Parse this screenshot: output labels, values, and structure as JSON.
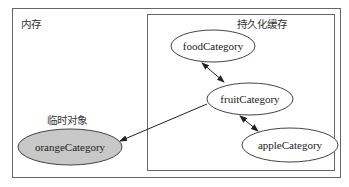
{
  "diagram": {
    "regions": {
      "memory": {
        "label": "内存"
      },
      "persistent_cache": {
        "label": "持久化缓存"
      }
    },
    "nodes": [
      {
        "id": "food",
        "label": "foodCategory",
        "fill": "#ffffff"
      },
      {
        "id": "fruit",
        "label": "fruitCategory",
        "fill": "#ffffff"
      },
      {
        "id": "apple",
        "label": "appleCategory",
        "fill": "#ffffff"
      },
      {
        "id": "orange",
        "label": "orangeCategory",
        "fill": "#c8c8c8"
      }
    ],
    "temp_label": "临时对象",
    "edges": [
      {
        "from": "food",
        "to": "fruit",
        "type": "bidirectional"
      },
      {
        "from": "fruit",
        "to": "apple",
        "type": "bidirectional"
      },
      {
        "from": "fruit",
        "to": "orange",
        "type": "directed"
      }
    ]
  }
}
